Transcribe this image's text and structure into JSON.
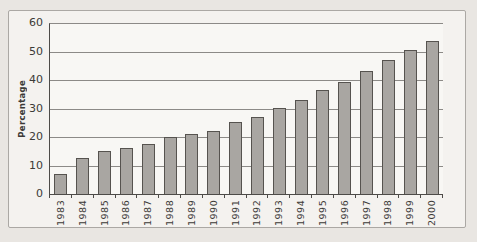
{
  "frame": {
    "background": "#f4f2ef",
    "border_color": "#aba8a4"
  },
  "chart_data": {
    "type": "bar",
    "title": "",
    "xlabel": "",
    "ylabel": "Percentage",
    "categories": [
      "1983",
      "1984",
      "1985",
      "1986",
      "1987",
      "1988",
      "1989",
      "1990",
      "1991",
      "1992",
      "1993",
      "1994",
      "1995",
      "1996",
      "1997",
      "1998",
      "1999",
      "2000"
    ],
    "values": [
      7.5,
      13,
      15.5,
      16.5,
      18,
      20.5,
      21.5,
      22.5,
      25.5,
      27.5,
      30.5,
      33.5,
      37,
      39.5,
      43.5,
      47.5,
      51,
      54
    ],
    "ylim": [
      0,
      60
    ],
    "yticks": [
      0,
      10,
      20,
      30,
      40,
      50,
      60
    ],
    "grid": "horizontal",
    "legend": "none",
    "bar_color": "#a9a6a2",
    "bar_border_color": "#56534f",
    "gridline_color": "#8c8a87",
    "axis_color": "#4d4b48",
    "text_color": "#3c3a37"
  }
}
